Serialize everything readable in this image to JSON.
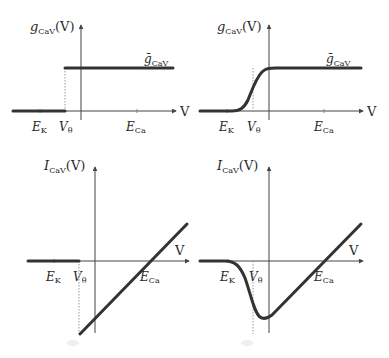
{
  "panels": [
    {
      "id": "g-step",
      "y_label": {
        "main": "g",
        "sub": "Ca",
        "subsub": "V",
        "suffix": "(V)"
      },
      "x_label": "V",
      "level_label": {
        "main": "ḡ",
        "sub": "Ca",
        "subsub": "V"
      },
      "ticks": [
        {
          "main": "E",
          "sub": "K"
        },
        {
          "main": "V",
          "sub": "θ"
        },
        {
          "main": "E",
          "sub": "Ca"
        }
      ]
    },
    {
      "id": "g-sigmoid",
      "y_label": {
        "main": "g",
        "sub": "Ca",
        "subsub": "V",
        "suffix": "(V)"
      },
      "x_label": "V",
      "level_label": {
        "main": "ḡ",
        "sub": "Ca",
        "subsub": "V"
      },
      "ticks": [
        {
          "main": "E",
          "sub": "K"
        },
        {
          "main": "V",
          "sub": "θ"
        },
        {
          "main": "E",
          "sub": "Ca"
        }
      ]
    },
    {
      "id": "I-step",
      "y_label": {
        "main": "I",
        "sub": "Ca",
        "subsub": "V",
        "suffix": "(V)"
      },
      "x_label": "V",
      "ticks": [
        {
          "main": "E",
          "sub": "K"
        },
        {
          "main": "V",
          "sub": "θ"
        },
        {
          "main": "E",
          "sub": "Ca"
        }
      ]
    },
    {
      "id": "I-smooth",
      "y_label": {
        "main": "I",
        "sub": "Ca",
        "subsub": "V",
        "suffix": "(V)"
      },
      "x_label": "V",
      "ticks": [
        {
          "main": "E",
          "sub": "K"
        },
        {
          "main": "V",
          "sub": "θ"
        },
        {
          "main": "E",
          "sub": "Ca"
        }
      ]
    }
  ],
  "colors": {
    "curve": "#333333",
    "axis": "#444444",
    "guide": "#999999"
  }
}
